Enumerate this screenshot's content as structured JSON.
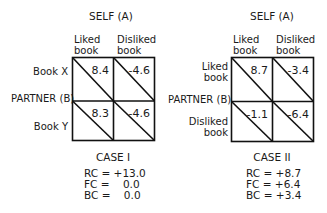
{
  "case1": {
    "self_label": "SELF (A)",
    "col_headers": [
      "Liked\nbook",
      "Disliked\nbook"
    ],
    "col_header_lines": [
      [
        "Liked",
        "book"
      ],
      [
        "Disliked",
        "book"
      ]
    ],
    "partner_label": "PARTNER (B)",
    "row_labels": [
      "Book X",
      "Book Y"
    ],
    "cells": [
      [
        "8.4",
        "-4.6"
      ],
      [
        "8.3",
        "-4.6"
      ]
    ],
    "title": "CASE I",
    "stats": [
      {
        "name": "RC",
        "value": "+13.0"
      },
      {
        "name": "FC",
        "value": "0.0"
      },
      {
        "name": "BC",
        "value": "0.0"
      }
    ]
  },
  "case2": {
    "self_label": "SELF (A)",
    "col_header_lines": [
      [
        "Liked",
        "book"
      ],
      [
        "Disliked",
        "book"
      ]
    ],
    "partner_label": "PARTNER (B)",
    "row_label_lines": [
      [
        "Liked",
        "book"
      ],
      [
        "Disliked",
        "book"
      ]
    ],
    "cells": [
      [
        "8.7",
        "-3.4"
      ],
      [
        "-1.1",
        "-6.4"
      ]
    ],
    "title": "CASE II",
    "stats": [
      {
        "name": "RC",
        "value": "+8.7"
      },
      {
        "name": "FC",
        "value": "+6.4"
      },
      {
        "name": "BC",
        "value": "+3.4"
      }
    ]
  }
}
